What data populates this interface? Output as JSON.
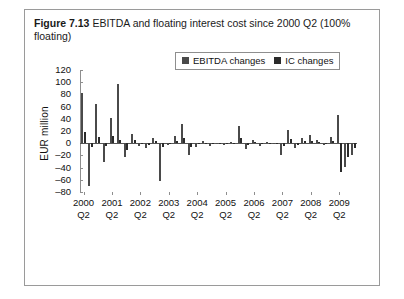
{
  "figure": {
    "label": "Figure 7.13",
    "caption": "EBITDA and floating interest cost since 2000 Q2 (100% floating)"
  },
  "legend": {
    "position": "top-right-inside",
    "items": [
      {
        "name": "EBITDA changes",
        "color": "#4a4a4a"
      },
      {
        "name": "IC changes",
        "color": "#2b2b2b"
      }
    ]
  },
  "chart_data": {
    "type": "bar",
    "title": "EBITDA and floating interest cost since 2000 Q2 (100% floating)",
    "xlabel": "",
    "ylabel": "EUR million",
    "ylim": [
      -80,
      120
    ],
    "yticks": [
      120,
      100,
      80,
      60,
      40,
      20,
      0,
      -20,
      -40,
      -60,
      -80
    ],
    "grid": false,
    "xtick_labels": [
      {
        "year": "2000",
        "quarter": "Q2"
      },
      {
        "year": "2001",
        "quarter": "Q2"
      },
      {
        "year": "2002",
        "quarter": "Q2"
      },
      {
        "year": "2003",
        "quarter": "Q2"
      },
      {
        "year": "2004",
        "quarter": "Q2"
      },
      {
        "year": "2005",
        "quarter": "Q2"
      },
      {
        "year": "2006",
        "quarter": "Q2"
      },
      {
        "year": "2007",
        "quarter": "Q2"
      },
      {
        "year": "2008",
        "quarter": "Q2"
      },
      {
        "year": "2009",
        "quarter": "Q2"
      }
    ],
    "categories": [
      "2000 Q2",
      "2000 Q3",
      "2000 Q4",
      "2001 Q1",
      "2001 Q2",
      "2001 Q3",
      "2001 Q4",
      "2002 Q1",
      "2002 Q2",
      "2002 Q3",
      "2002 Q4",
      "2003 Q1",
      "2003 Q2",
      "2003 Q3",
      "2003 Q4",
      "2004 Q1",
      "2004 Q2",
      "2004 Q3",
      "2004 Q4",
      "2005 Q1",
      "2005 Q2",
      "2005 Q3",
      "2005 Q4",
      "2006 Q1",
      "2006 Q2",
      "2006 Q3",
      "2006 Q4",
      "2007 Q1",
      "2007 Q2",
      "2007 Q3",
      "2007 Q4",
      "2008 Q1",
      "2008 Q2",
      "2008 Q3",
      "2008 Q4",
      "2009 Q1",
      "2009 Q2",
      "2009 Q3",
      "2009 Q4"
    ],
    "series": [
      {
        "name": "EBITDA changes",
        "color": "#4a4a4a",
        "values": [
          83,
          -70,
          65,
          -31,
          41,
          97,
          -22,
          15,
          -4,
          -8,
          8,
          -62,
          -3,
          11,
          31,
          -20,
          -6,
          4,
          -5,
          -2,
          -3,
          2,
          28,
          -9,
          6,
          -5,
          2,
          -1,
          -19,
          22,
          -8,
          9,
          13,
          5,
          -3,
          10,
          47,
          -39,
          -19
        ]
      },
      {
        "name": "IC changes",
        "color": "#2b2b2b",
        "values": [
          18,
          -7,
          10,
          -5,
          12,
          6,
          -11,
          5,
          -2,
          -3,
          3,
          -6,
          -1,
          4,
          9,
          -7,
          -2,
          1,
          -2,
          -1,
          -1,
          1,
          8,
          -3,
          2,
          -2,
          1,
          -1,
          -5,
          7,
          -3,
          3,
          4,
          2,
          -1,
          3,
          -47,
          -23,
          -8
        ]
      }
    ]
  }
}
